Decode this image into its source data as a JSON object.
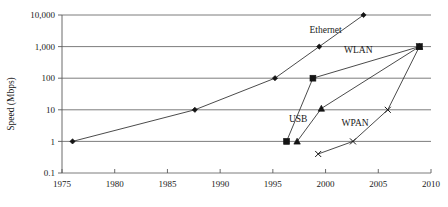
{
  "chart_data": {
    "type": "line",
    "title": "",
    "xlabel": "",
    "ylabel": "Speed (Mbps)",
    "yscale": "log",
    "ylim": [
      0.1,
      10000
    ],
    "xlim": [
      1975,
      2010
    ],
    "grid": true,
    "legend_position": "inline-annotations",
    "y_ticks": [
      "10,000",
      "1,000",
      "100",
      "10",
      "1",
      "0.1"
    ],
    "y_tick_values": [
      10000,
      1000,
      100,
      10,
      1,
      0.1
    ],
    "x_ticks": [
      "1975",
      "1980",
      "1985",
      "1990",
      "1995",
      "2000",
      "2005",
      "2010"
    ],
    "x_tick_values": [
      1975,
      1980,
      1985,
      1990,
      1995,
      2000,
      2005,
      2010
    ],
    "series": [
      {
        "name": "Ethernet",
        "marker": "diamond",
        "points": [
          {
            "x": 1976.0,
            "y": 1
          },
          {
            "x": 1987.6,
            "y": 10
          },
          {
            "x": 1995.2,
            "y": 100
          },
          {
            "x": 1999.4,
            "y": 1000
          },
          {
            "x": 2003.6,
            "y": 10000
          }
        ]
      },
      {
        "name": "USB",
        "marker": "square",
        "points": [
          {
            "x": 1996.3,
            "y": 1
          },
          {
            "x": 1998.8,
            "y": 100
          },
          {
            "x": 2008.9,
            "y": 1000
          }
        ]
      },
      {
        "name": "WLAN",
        "marker": "triangle",
        "points": [
          {
            "x": 1997.3,
            "y": 1
          },
          {
            "x": 1999.6,
            "y": 11
          },
          {
            "x": 2008.9,
            "y": 1000
          }
        ]
      },
      {
        "name": "WPAN",
        "marker": "cross",
        "points": [
          {
            "x": 1999.3,
            "y": 0.4
          },
          {
            "x": 2002.6,
            "y": 1
          },
          {
            "x": 2005.9,
            "y": 10
          },
          {
            "x": 2008.9,
            "y": 1000
          }
        ]
      }
    ],
    "annotations": [
      {
        "text": "Ethernet",
        "x": 2000.0,
        "y": 2600,
        "name": "ethernet"
      },
      {
        "text": "WLAN",
        "x": 2003.1,
        "y": 620,
        "name": "wlan"
      },
      {
        "text": "USB",
        "x": 1997.4,
        "y": 4.2,
        "name": "usb"
      },
      {
        "text": "WPAN",
        "x": 2002.8,
        "y": 3.1,
        "name": "wpan"
      }
    ]
  }
}
